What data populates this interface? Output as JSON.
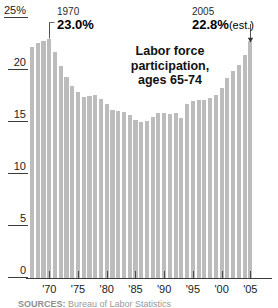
{
  "chart_data": {
    "type": "bar",
    "title": "Labor force participation, ages 65-74",
    "title_lines": [
      "Labor force",
      "participation,",
      "ages 65-74"
    ],
    "xlabel": "",
    "ylabel": "",
    "ylim": [
      0,
      25
    ],
    "y_unit": "%",
    "grid": true,
    "gridlines": [
      5,
      10,
      15,
      20
    ],
    "legend": "none",
    "bar_color": "#bcbcbc",
    "y_ticks": [
      {
        "value": 25,
        "label": "25%"
      },
      {
        "value": 20,
        "label": "20"
      },
      {
        "value": 15,
        "label": "15"
      },
      {
        "value": 10,
        "label": "10"
      },
      {
        "value": 5,
        "label": "5"
      },
      {
        "value": 0,
        "label": "0"
      }
    ],
    "x_ticks": [
      {
        "value": 1970,
        "label": "'70"
      },
      {
        "value": 1975,
        "label": "'75"
      },
      {
        "value": 1980,
        "label": "'80"
      },
      {
        "value": 1985,
        "label": "'85"
      },
      {
        "value": 1990,
        "label": "'90"
      },
      {
        "value": 1995,
        "label": "'95"
      },
      {
        "value": 2000,
        "label": "'00"
      },
      {
        "value": 2005,
        "label": "'05"
      }
    ],
    "x_start": 1967,
    "x_end": 2005,
    "categories": [
      1967,
      1968,
      1969,
      1970,
      1971,
      1972,
      1973,
      1974,
      1975,
      1976,
      1977,
      1978,
      1979,
      1980,
      1981,
      1982,
      1983,
      1984,
      1985,
      1986,
      1987,
      1988,
      1989,
      1990,
      1991,
      1992,
      1993,
      1994,
      1995,
      1996,
      1997,
      1998,
      1999,
      2000,
      2001,
      2002,
      2003,
      2004,
      2005
    ],
    "values": [
      22.2,
      22.6,
      22.8,
      23.0,
      21.7,
      20.4,
      19.3,
      18.5,
      17.9,
      17.4,
      17.5,
      17.6,
      17.2,
      16.7,
      16.2,
      16.1,
      16.0,
      15.7,
      15.2,
      15.0,
      15.1,
      15.5,
      15.9,
      15.9,
      15.8,
      15.9,
      15.4,
      16.7,
      17.0,
      17.1,
      17.1,
      17.3,
      17.6,
      18.3,
      19.2,
      19.9,
      20.5,
      21.4,
      22.8
    ]
  },
  "annotations": {
    "left": {
      "year": "1970",
      "value": "23.0%",
      "suffix": ""
    },
    "right": {
      "year": "2005",
      "value": "22.8%",
      "suffix": "(est.)"
    }
  },
  "source": {
    "prefix": "SOURCES:",
    "text": "Bureau of Labor Statistics"
  }
}
